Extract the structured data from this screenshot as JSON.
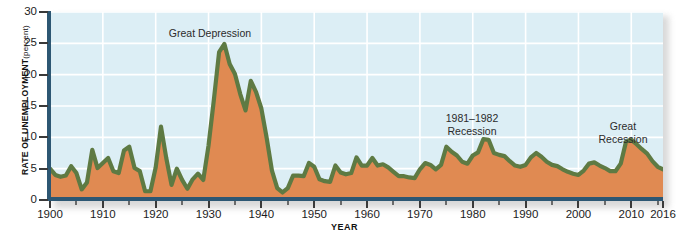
{
  "chart_data": {
    "type": "area",
    "title": "",
    "xlabel": "YEAR",
    "ylabel": "RATE OF UNEMPLOYMENT",
    "ylabel_unit": "(percent)",
    "xlim": [
      1900,
      2016
    ],
    "ylim": [
      0,
      30
    ],
    "ytick_step": 5,
    "xtick_major_step": 10,
    "xtick_minor_step": 5,
    "grid": true,
    "legend": "none",
    "series_name": "Rate of unemployment",
    "line_color": "#5e7a43",
    "fill_color": "#e08a52",
    "plot_background": "#dceef5",
    "gridline_color": "#ffffff",
    "axis_color": "#2d5773",
    "yticks": [
      "0",
      "5",
      "10",
      "15",
      "20",
      "25",
      "30"
    ],
    "xticks": [
      "1900",
      "1910",
      "1920",
      "1930",
      "1940",
      "1950",
      "1960",
      "1970",
      "1980",
      "1990",
      "2000",
      "2010",
      "2016"
    ],
    "xticks_minor": [
      1905,
      1915,
      1925,
      1935,
      1945,
      1955,
      1965,
      1975,
      1985,
      1995,
      2005,
      2015
    ],
    "annotations": [
      {
        "id": "great-depression",
        "text": "Great Depression",
        "x": 1932,
        "y": 29
      },
      {
        "id": "recession-1981-1982",
        "text": "1981–1982\nRecession",
        "x": 1981,
        "y": 16
      },
      {
        "id": "great-recession",
        "text": "Great\nRecession",
        "x": 2010,
        "y": 15
      }
    ],
    "x": [
      1900,
      1901,
      1902,
      1903,
      1904,
      1905,
      1906,
      1907,
      1908,
      1909,
      1910,
      1911,
      1912,
      1913,
      1914,
      1915,
      1916,
      1917,
      1918,
      1919,
      1920,
      1921,
      1922,
      1923,
      1924,
      1925,
      1926,
      1927,
      1928,
      1929,
      1930,
      1931,
      1932,
      1933,
      1934,
      1935,
      1936,
      1937,
      1938,
      1939,
      1940,
      1941,
      1942,
      1943,
      1944,
      1945,
      1946,
      1947,
      1948,
      1949,
      1950,
      1951,
      1952,
      1953,
      1954,
      1955,
      1956,
      1957,
      1958,
      1959,
      1960,
      1961,
      1962,
      1963,
      1964,
      1965,
      1966,
      1967,
      1968,
      1969,
      1970,
      1971,
      1972,
      1973,
      1974,
      1975,
      1976,
      1977,
      1978,
      1979,
      1980,
      1981,
      1982,
      1983,
      1984,
      1985,
      1986,
      1987,
      1988,
      1989,
      1990,
      1991,
      1992,
      1993,
      1994,
      1995,
      1996,
      1997,
      1998,
      1999,
      2000,
      2001,
      2002,
      2003,
      2004,
      2005,
      2006,
      2007,
      2008,
      2009,
      2010,
      2011,
      2012,
      2013,
      2014,
      2015,
      2016
    ],
    "values": [
      5.0,
      4.0,
      3.7,
      3.9,
      5.4,
      4.3,
      1.7,
      2.8,
      8.0,
      5.1,
      5.9,
      6.7,
      4.6,
      4.3,
      7.9,
      8.5,
      5.1,
      4.6,
      1.4,
      1.4,
      5.2,
      11.7,
      6.7,
      2.4,
      5.0,
      3.2,
      1.8,
      3.3,
      4.2,
      3.2,
      8.7,
      15.9,
      23.6,
      24.9,
      21.7,
      20.1,
      16.9,
      14.3,
      19.0,
      17.2,
      14.6,
      9.9,
      4.7,
      1.9,
      1.2,
      1.9,
      3.9,
      3.9,
      3.8,
      5.9,
      5.3,
      3.3,
      3.0,
      2.9,
      5.5,
      4.4,
      4.1,
      4.3,
      6.8,
      5.5,
      5.5,
      6.7,
      5.5,
      5.7,
      5.2,
      4.5,
      3.8,
      3.8,
      3.6,
      3.5,
      4.9,
      5.9,
      5.6,
      4.9,
      5.6,
      8.5,
      7.7,
      7.1,
      6.1,
      5.8,
      7.1,
      7.6,
      9.7,
      9.6,
      7.5,
      7.2,
      7.0,
      6.2,
      5.5,
      5.3,
      5.6,
      6.8,
      7.5,
      6.9,
      6.1,
      5.6,
      5.4,
      4.9,
      4.5,
      4.2,
      4.0,
      4.7,
      5.8,
      6.0,
      5.5,
      5.1,
      4.6,
      4.6,
      5.8,
      9.3,
      9.6,
      8.9,
      8.1,
      7.4,
      6.2,
      5.3,
      4.9
    ]
  }
}
